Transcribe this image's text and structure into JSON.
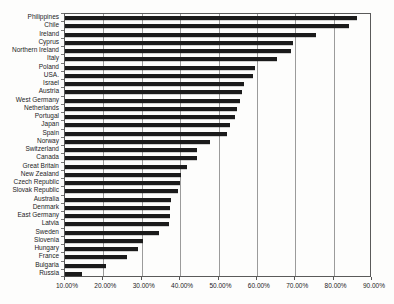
{
  "figure": {
    "background": "#fdfdfc",
    "bar_color": "#1b1b1b",
    "gridline_color": "#9b9b9b",
    "border_color": "#5a5a5a",
    "text_color": "#1c1c1c"
  },
  "chart_data": {
    "type": "bar",
    "orientation": "horizontal",
    "title": "",
    "xlabel": "",
    "ylabel": "",
    "xlim": [
      10,
      90
    ],
    "grid": "vertical",
    "legend": "none",
    "x_tick_values": [
      10,
      20,
      30,
      40,
      50,
      60,
      70,
      80,
      90
    ],
    "x_tick_labels": [
      "10.00%",
      "20.00%",
      "30.00%",
      "40.00%",
      "50.00%",
      "60.00%",
      "70.00%",
      "80.00%",
      "90.00%"
    ],
    "categories": [
      "Philippines",
      "Chile",
      "Ireland",
      "Cyprus",
      "Northern Ireland",
      "Italy",
      "Poland",
      "USA.",
      "Israel",
      "Austria",
      "West Germany",
      "Netherlands",
      "Portugal",
      "Japan",
      "Spain",
      "Norway",
      "Switzerland",
      "Canada",
      "Great Britain",
      "New Zealand",
      "Czech Republic",
      "Slovak Republic",
      "Australia",
      "Denmark",
      "East Germany",
      "Latvia",
      "Sweden",
      "Slovenia",
      "Hungary",
      "France",
      "Bulgaria",
      "Russia"
    ],
    "values": [
      86.2,
      84.0,
      75.4,
      69.5,
      68.9,
      65.2,
      59.6,
      59.0,
      56.6,
      56.1,
      55.7,
      54.9,
      54.4,
      53.0,
      52.2,
      47.7,
      44.5,
      44.3,
      41.8,
      40.2,
      39.9,
      39.5,
      37.6,
      37.4,
      37.3,
      37.1,
      34.6,
      30.4,
      29.1,
      26.2,
      20.6,
      14.3
    ],
    "unit": "%"
  }
}
